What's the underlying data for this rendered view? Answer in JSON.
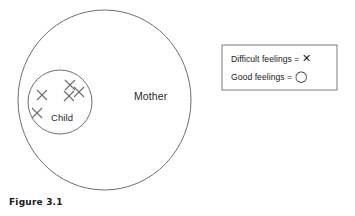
{
  "figure": {
    "caption": "Figure 3.1"
  },
  "diagram": {
    "outer_circle": {
      "label": "Mother",
      "name": "mother-circle",
      "cx": 104.5,
      "cy": 100,
      "rx": 86.5,
      "ry": 90,
      "stroke": "#6e6e6e"
    },
    "inner_circle": {
      "label": "Child",
      "name": "child-circle",
      "cx": 60,
      "cy": 102,
      "rx": 32,
      "ry": 32,
      "stroke": "#6e6e6e"
    },
    "marks": [
      {
        "symbol": "X",
        "meaning": "Difficult feelings",
        "cx": 70,
        "cy": 85,
        "size": 5
      },
      {
        "symbol": "X",
        "meaning": "Difficult feelings",
        "cx": 42,
        "cy": 95,
        "size": 5
      },
      {
        "symbol": "X",
        "meaning": "Difficult feelings",
        "cx": 69,
        "cy": 96,
        "size": 5
      },
      {
        "symbol": "X",
        "meaning": "Difficult feelings",
        "cx": 79,
        "cy": 92,
        "size": 5
      },
      {
        "symbol": "X",
        "meaning": "Difficult feelings",
        "cx": 37,
        "cy": 113,
        "size": 5
      }
    ],
    "mark_count": 5
  },
  "legend": {
    "box": {
      "x": 222,
      "y": 45,
      "width": 115,
      "height": 45,
      "stroke": "#7a7a7a"
    },
    "rows": [
      {
        "text": "Difficult feelings =",
        "symbol": "✕",
        "symbol_name": "x-symbol"
      },
      {
        "text": "Good feelings =",
        "symbol": "◯",
        "symbol_name": "o-symbol"
      }
    ]
  },
  "colors": {
    "stroke": "#6e6e6e",
    "text": "#1a1a1a",
    "background": "#ffffff"
  }
}
